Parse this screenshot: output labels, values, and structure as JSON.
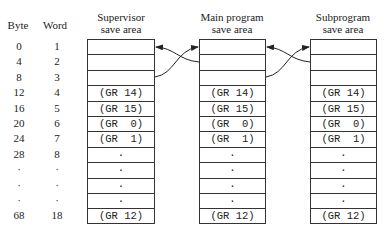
{
  "headers": {
    "byte": "Byte",
    "word": "Word",
    "areas": [
      {
        "line1": "Supervisor",
        "line2": "save area"
      },
      {
        "line1": "Main program",
        "line2": "save area"
      },
      {
        "line1": "Subprogram",
        "line2": "save area"
      }
    ]
  },
  "byte_offsets": [
    "0",
    "4",
    "8",
    "12",
    "16",
    "20",
    "24",
    "28",
    "·",
    "·",
    "·",
    "68"
  ],
  "word_numbers": [
    "1",
    "2",
    "3",
    "4",
    "5",
    "6",
    "7",
    "8",
    "·",
    "·",
    "·",
    "18"
  ],
  "cells": [
    "",
    "",
    "",
    "(GR 14)",
    "(GR 15)",
    "(GR  0)",
    "(GR  1)",
    "·",
    "·",
    "·",
    "·",
    "(GR 12)"
  ]
}
